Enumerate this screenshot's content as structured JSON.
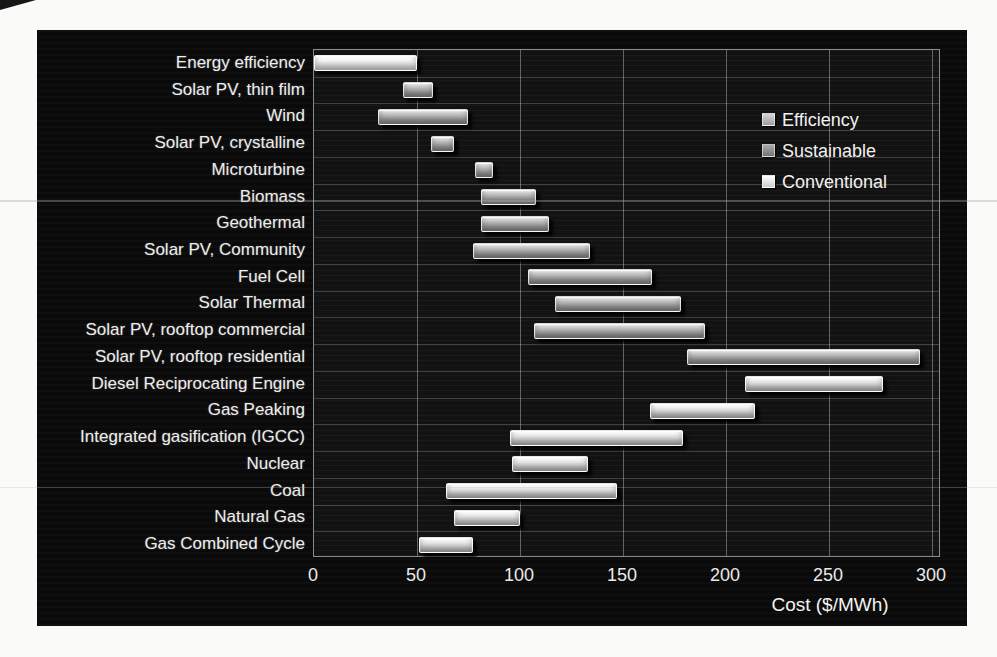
{
  "panel": {
    "background": "#0a0a0a"
  },
  "legend": {
    "items": [
      {
        "label": "Efficiency",
        "series": "efficiency"
      },
      {
        "label": "Sustainable",
        "series": "sustainable"
      },
      {
        "label": "Conventional",
        "series": "conventional"
      }
    ]
  },
  "chart_data": {
    "type": "bar",
    "subtype": "horizontal-range-bars",
    "title": "",
    "xlabel": "Cost ($/MWh)",
    "ylabel": "",
    "xlim": [
      0,
      300
    ],
    "x_ticks": [
      0,
      50,
      100,
      150,
      200,
      250,
      300
    ],
    "grid": true,
    "legend_position": "inside-top-right",
    "series": [
      {
        "name": "Efficiency",
        "key": "efficiency",
        "color": "#f0f0f0"
      },
      {
        "name": "Sustainable",
        "key": "sustainable",
        "color": "#b3b3b3"
      },
      {
        "name": "Conventional",
        "key": "conventional",
        "color": "#e6e6e6"
      }
    ],
    "categories": [
      {
        "label": "Energy efficiency",
        "series": "efficiency",
        "low": 0,
        "high": 50
      },
      {
        "label": "Solar PV, thin film",
        "series": "sustainable",
        "low": 43,
        "high": 58
      },
      {
        "label": "Wind",
        "series": "sustainable",
        "low": 31,
        "high": 75
      },
      {
        "label": "Solar PV, crystalline",
        "series": "sustainable",
        "low": 57,
        "high": 68
      },
      {
        "label": "Microturbine",
        "series": "sustainable",
        "low": 78,
        "high": 87
      },
      {
        "label": "Biomass",
        "series": "sustainable",
        "low": 81,
        "high": 108
      },
      {
        "label": "Geothermal",
        "series": "sustainable",
        "low": 81,
        "high": 114
      },
      {
        "label": "Solar PV, Community",
        "series": "sustainable",
        "low": 77,
        "high": 134
      },
      {
        "label": "Fuel Cell",
        "series": "sustainable",
        "low": 104,
        "high": 164
      },
      {
        "label": "Solar Thermal",
        "series": "sustainable",
        "low": 117,
        "high": 178
      },
      {
        "label": "Solar PV, rooftop commercial",
        "series": "sustainable",
        "low": 107,
        "high": 190
      },
      {
        "label": "Solar PV, rooftop residential",
        "series": "sustainable",
        "low": 181,
        "high": 294
      },
      {
        "label": "Diesel Reciprocating Engine",
        "series": "conventional",
        "low": 209,
        "high": 276
      },
      {
        "label": "Gas Peaking",
        "series": "conventional",
        "low": 163,
        "high": 214
      },
      {
        "label": "Integrated gasification (IGCC)",
        "series": "conventional",
        "low": 95,
        "high": 179
      },
      {
        "label": "Nuclear",
        "series": "conventional",
        "low": 96,
        "high": 133
      },
      {
        "label": "Coal",
        "series": "conventional",
        "low": 64,
        "high": 147
      },
      {
        "label": "Natural Gas",
        "series": "conventional",
        "low": 68,
        "high": 100
      },
      {
        "label": "Gas Combined Cycle",
        "series": "conventional",
        "low": 51,
        "high": 77
      }
    ]
  }
}
